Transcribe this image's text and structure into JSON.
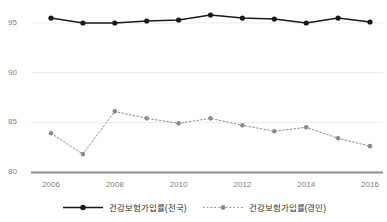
{
  "chart_data": {
    "type": "line",
    "title": "",
    "subtitle": "",
    "xlabel": "",
    "ylabel": "",
    "x": [
      2006,
      2007,
      2008,
      2009,
      2010,
      2011,
      2012,
      2013,
      2014,
      2015,
      2016
    ],
    "categories": [
      "2006",
      "2007",
      "2008",
      "2009",
      "2010",
      "2011",
      "2012",
      "2013",
      "2014",
      "2015",
      "2016"
    ],
    "x_tick_labels": [
      "2006",
      "2008",
      "2010",
      "2012",
      "2014",
      "2016"
    ],
    "y_tick_labels": [
      "80",
      "85",
      "90",
      "95"
    ],
    "y_ticks": [
      80,
      85,
      90,
      95
    ],
    "ylim": [
      80,
      96.5
    ],
    "xlim": [
      2005.6,
      2016.5
    ],
    "grid": true,
    "grid_axis": "y",
    "legend_position": "bottom",
    "series": [
      {
        "name": "건강보험가입률(전국)",
        "values": [
          95.5,
          95.0,
          95.0,
          95.2,
          95.3,
          95.8,
          95.5,
          95.4,
          95.0,
          95.5,
          95.1
        ],
        "color": "#1a1a1a",
        "linestyle": "solid",
        "marker": "circle"
      },
      {
        "name": "건강보험가입률(경인)",
        "values": [
          83.9,
          81.8,
          86.1,
          85.4,
          84.9,
          85.4,
          84.7,
          84.1,
          84.5,
          83.4,
          82.6
        ],
        "color": "#8a8a92",
        "linestyle": "dotted",
        "marker": "circle"
      }
    ]
  },
  "legend": {
    "entries": [
      {
        "label": "건강보험가입률(전국)"
      },
      {
        "label": "건강보험가입률(경인)"
      }
    ]
  },
  "axis": {
    "y_labels": [
      "95",
      "90",
      "85",
      "80"
    ],
    "x_labels": [
      "2006",
      "2008",
      "2010",
      "2012",
      "2014",
      "2016"
    ]
  },
  "colors": {
    "series_national": "#1a1a1a",
    "series_region": "#8a8a92",
    "grid": "#ebebeb",
    "axis_line": "#8c8c8c",
    "tick_text": "#808080",
    "background": "#ffffff"
  }
}
